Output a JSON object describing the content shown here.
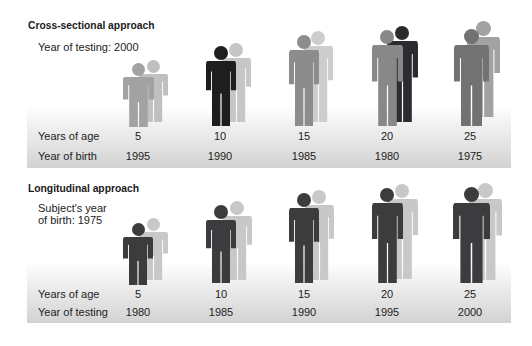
{
  "sections": [
    {
      "title": "Cross-sectional approach",
      "subtitle": [
        "Year of testing: 2000"
      ],
      "row1_label": "Years of age",
      "row2_label": "Year of birth",
      "columns": [
        {
          "age": "5",
          "year": "1995",
          "back": {
            "cx": 153,
            "feet": 122,
            "h": 62,
            "w": 29,
            "color": "#c0c0c0"
          },
          "front": {
            "cx": 138,
            "feet": 127,
            "h": 64,
            "w": 31,
            "color": "#a2a2a2"
          }
        },
        {
          "age": "10",
          "year": "1990",
          "back": {
            "cx": 236,
            "feet": 122,
            "h": 79,
            "w": 29,
            "color": "#c6c6c6"
          },
          "front": {
            "cx": 221,
            "feet": 126,
            "h": 80,
            "w": 30,
            "color": "#1e1e1e"
          }
        },
        {
          "age": "15",
          "year": "1985",
          "back": {
            "cx": 318,
            "feet": 122,
            "h": 91,
            "w": 29,
            "color": "#cdcdcd"
          },
          "front": {
            "cx": 304,
            "feet": 126,
            "h": 91,
            "w": 30,
            "color": "#8c8c8c"
          }
        },
        {
          "age": "20",
          "year": "1980",
          "back": {
            "cx": 402,
            "feet": 122,
            "h": 96,
            "w": 31,
            "color": "#2c2c30"
          },
          "front": {
            "cx": 387,
            "feet": 126,
            "h": 96,
            "w": 31,
            "color": "#888888"
          }
        },
        {
          "age": "25",
          "year": "1975",
          "back": {
            "cx": 483,
            "feet": 117,
            "h": 96,
            "w": 33,
            "color": "#a2a2a2"
          },
          "front": {
            "cx": 471,
            "feet": 126,
            "h": 97,
            "w": 35,
            "color": "#727272"
          }
        }
      ]
    },
    {
      "title": "Longitudinal approach",
      "subtitle": [
        "Subject's year",
        "of birth: 1975"
      ],
      "row1_label": "Years of age",
      "row2_label": "Year of testing",
      "columns": [
        {
          "age": "5",
          "year": "1980",
          "back": {
            "cx": 153,
            "feet": 280,
            "h": 62,
            "w": 29,
            "color": "#c8c8c8"
          },
          "front": {
            "cx": 138,
            "feet": 285,
            "h": 62,
            "w": 30,
            "color": "#3c3c3e"
          }
        },
        {
          "age": "10",
          "year": "1985",
          "back": {
            "cx": 237,
            "feet": 280,
            "h": 79,
            "w": 29,
            "color": "#c8c8c8"
          },
          "front": {
            "cx": 221,
            "feet": 283,
            "h": 78,
            "w": 30,
            "color": "#3c3c3e"
          }
        },
        {
          "age": "15",
          "year": "1990",
          "back": {
            "cx": 319,
            "feet": 280,
            "h": 90,
            "w": 29,
            "color": "#c8c8c8"
          },
          "front": {
            "cx": 304,
            "feet": 283,
            "h": 90,
            "w": 30,
            "color": "#3c3c3e"
          }
        },
        {
          "age": "20",
          "year": "1995",
          "back": {
            "cx": 402,
            "feet": 279,
            "h": 95,
            "w": 31,
            "color": "#c8c8c8"
          },
          "front": {
            "cx": 387,
            "feet": 283,
            "h": 95,
            "w": 31,
            "color": "#3c3c3e"
          }
        },
        {
          "age": "25",
          "year": "2000",
          "back": {
            "cx": 485,
            "feet": 280,
            "h": 97,
            "w": 33,
            "color": "#c8c8c8"
          },
          "front": {
            "cx": 471,
            "feet": 283,
            "h": 96,
            "w": 37,
            "color": "#3c3c3e"
          }
        }
      ]
    }
  ]
}
